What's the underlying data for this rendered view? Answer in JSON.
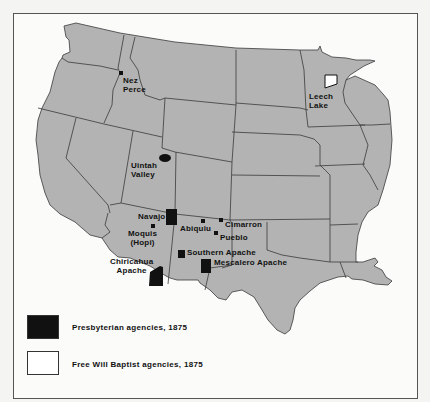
{
  "map": {
    "region": "Western United States",
    "colors": {
      "land": "#b3b3b3",
      "border": "#3a3a3a",
      "presbyterian": "#111111",
      "free_will_baptist": "#ffffff",
      "background": "#fbfbfa"
    },
    "agencies": [
      {
        "name": "Nez Perce",
        "line1": "Nez",
        "line2": "Perce",
        "denomination": "Presbyterian"
      },
      {
        "name": "Uintah Valley",
        "line1": "Uintah",
        "line2": "Valley",
        "denomination": "Presbyterian"
      },
      {
        "name": "Navajo",
        "line1": "Navajo",
        "denomination": "Presbyterian"
      },
      {
        "name": "Moquis (Hopi)",
        "line1": "Moquis",
        "line2": "(Hopi)",
        "denomination": "Presbyterian"
      },
      {
        "name": "Abiquiu",
        "line1": "Abiquiu",
        "denomination": "Presbyterian"
      },
      {
        "name": "Cimarron",
        "line1": "Cimarron",
        "denomination": "Presbyterian"
      },
      {
        "name": "Pueblo",
        "line1": "Pueblo",
        "denomination": "Presbyterian"
      },
      {
        "name": "Southern Apache",
        "line1": "Southern Apache",
        "denomination": "Presbyterian"
      },
      {
        "name": "Mescalero Apache",
        "line1": "Mescalero Apache",
        "denomination": "Presbyterian"
      },
      {
        "name": "Chiricahua Apache",
        "line1": "Chiricahua",
        "line2": "Apache",
        "denomination": "Presbyterian"
      },
      {
        "name": "Leech Lake",
        "line1": "Leech",
        "line2": "Lake",
        "denomination": "Free Will Baptist"
      }
    ]
  },
  "legend": {
    "items": [
      {
        "label": "Presbyterian agencies, 1875",
        "color": "#111111"
      },
      {
        "label": "Free Will Baptist agencies, 1875",
        "color": "#ffffff"
      }
    ]
  }
}
